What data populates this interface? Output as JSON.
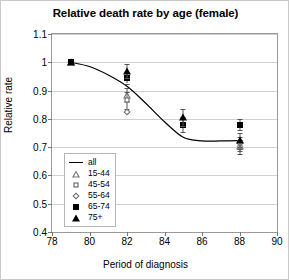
{
  "chart_data": {
    "type": "scatter",
    "title": "Relative death rate by age (female)",
    "xlabel": "Period of diagnosis",
    "ylabel": "Relative rate",
    "xlim": [
      78,
      90
    ],
    "ylim": [
      0.4,
      1.1
    ],
    "xticks": [
      78,
      80,
      82,
      84,
      86,
      88,
      90
    ],
    "yticks": [
      0.4,
      0.5,
      0.6,
      0.7,
      0.8,
      0.9,
      1.0,
      1.1
    ],
    "ytick_labels": [
      "0.4",
      "0.5",
      "0.6",
      "0.7",
      "0.8",
      "0.9",
      "1",
      "1.1"
    ],
    "grid": true,
    "legend_position": "inside-lower-left",
    "x": [
      79,
      82,
      85,
      88
    ],
    "series": [
      {
        "name": "all",
        "marker": "line",
        "values": [
          1.0,
          0.93,
          0.73,
          0.725
        ],
        "curve": [
          [
            79,
            1.0
          ],
          [
            80,
            0.985
          ],
          [
            81,
            0.955
          ],
          [
            82,
            0.915
          ],
          [
            83,
            0.855
          ],
          [
            84,
            0.79
          ],
          [
            85,
            0.735
          ],
          [
            86,
            0.722
          ],
          [
            87,
            0.722
          ],
          [
            88,
            0.723
          ]
        ]
      },
      {
        "name": "15-44",
        "marker": "triangle-open",
        "values": [
          1.0,
          0.885,
          null,
          0.705
        ],
        "errors": [
          null,
          0.025,
          null,
          0.02
        ]
      },
      {
        "name": "45-54",
        "marker": "square-open",
        "values": [
          1.0,
          0.865,
          null,
          0.7
        ],
        "errors": [
          null,
          0.03,
          null,
          0.025
        ]
      },
      {
        "name": "55-64",
        "marker": "diamond-open",
        "values": [
          1.0,
          0.825,
          null,
          0.715
        ],
        "errors": [
          null,
          null,
          null,
          0.02
        ]
      },
      {
        "name": "65-74",
        "marker": "square-filled",
        "values": [
          1.0,
          0.945,
          0.78,
          0.78
        ],
        "errors": [
          null,
          0.02,
          0.025,
          0.02
        ]
      },
      {
        "name": "75+",
        "marker": "triangle-filled",
        "values": [
          1.0,
          0.97,
          0.805,
          0.725
        ],
        "errors": [
          null,
          0.025,
          0.03,
          0.025
        ]
      }
    ]
  },
  "legend": {
    "items": [
      {
        "label": "all",
        "marker": "line"
      },
      {
        "label": "15-44",
        "marker": "triangle-open"
      },
      {
        "label": "45-54",
        "marker": "square-open"
      },
      {
        "label": "55-64",
        "marker": "diamond-open"
      },
      {
        "label": "65-74",
        "marker": "square-filled"
      },
      {
        "label": "75+",
        "marker": "triangle-filled"
      }
    ]
  },
  "colors": {
    "line": "#000000",
    "grid": "#d0d0d0",
    "axis": "#9a9a9a",
    "background": "#ffffff"
  }
}
